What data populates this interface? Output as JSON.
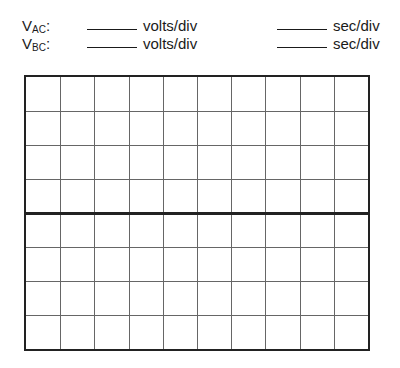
{
  "channels": [
    {
      "label": "V",
      "sub": "AC",
      "suffix": ":",
      "volts_unit": "volts/div",
      "time_unit": "sec/div",
      "volts_value": "",
      "time_value": ""
    },
    {
      "label": "V",
      "sub": "BC",
      "suffix": ":",
      "volts_unit": "volts/div",
      "time_unit": "sec/div",
      "volts_value": "",
      "time_value": ""
    }
  ],
  "grid": {
    "columns": 10,
    "rows": 8,
    "line_color": "#666666",
    "border_color": "#222222"
  }
}
